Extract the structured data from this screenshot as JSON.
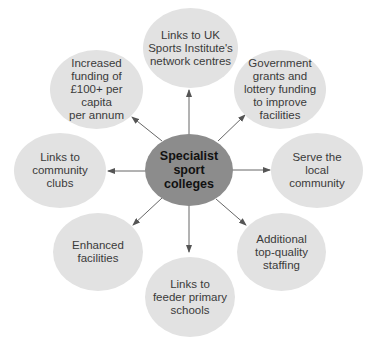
{
  "diagram": {
    "center": {
      "label": "Specialist\nsport\ncolleges"
    },
    "nodes": [
      {
        "id": "top",
        "label": "Links to UK\nSports Institute's\nnetwork centres"
      },
      {
        "id": "top-right",
        "label": "Government\ngrants and\nlottery funding\nto improve\nfacilities"
      },
      {
        "id": "right",
        "label": "Serve the\nlocal\ncommunity"
      },
      {
        "id": "bottom-right",
        "label": "Additional\ntop-quality\nstaffing"
      },
      {
        "id": "bottom",
        "label": "Links to\nfeeder primary\nschools"
      },
      {
        "id": "bottom-left",
        "label": "Enhanced\nfacilities"
      },
      {
        "id": "left",
        "label": "Links to\ncommunity\nclubs"
      },
      {
        "id": "top-left",
        "label": "Increased\nfunding of\n£100+ per capita\nper annum"
      }
    ],
    "colors": {
      "center_fill": "#8c8c8c",
      "node_fill": "#e2e2e2",
      "arrow": "#555555",
      "text": "#3a3a3a"
    }
  }
}
